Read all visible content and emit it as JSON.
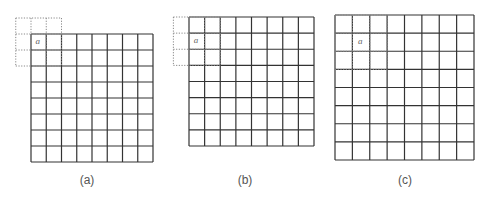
{
  "figure": {
    "panels": [
      {
        "id": "a",
        "caption": "(a)",
        "caption_x": 87,
        "grid": {
          "x": 31,
          "y": 34,
          "w": 122,
          "h": 128,
          "cols": 8,
          "rows": 8
        },
        "window": {
          "col": -1,
          "row": -1,
          "cols": 3,
          "rows": 3
        },
        "marker": {
          "label": "a",
          "col": 0,
          "row": 0
        }
      },
      {
        "id": "b",
        "caption": "(b)",
        "caption_x": 245,
        "grid": {
          "x": 189,
          "y": 17,
          "w": 125,
          "h": 129,
          "cols": 8,
          "rows": 8
        },
        "window": {
          "col": -1,
          "row": 0,
          "cols": 3,
          "rows": 3
        },
        "marker": {
          "label": "a",
          "col": 0,
          "row": 1
        }
      },
      {
        "id": "c",
        "caption": "(c)",
        "caption_x": 405,
        "grid": {
          "x": 335,
          "y": 15,
          "w": 139,
          "h": 145,
          "cols": 8,
          "rows": 8
        },
        "window": {
          "col": 0,
          "row": 0,
          "cols": 3,
          "rows": 3
        },
        "marker": {
          "label": "a",
          "col": 1,
          "row": 1
        }
      }
    ],
    "colors": {
      "grid_line": "#333333",
      "window_line": "#888888",
      "caption": "#555555",
      "marker": "#666666"
    },
    "caption_y": 173
  }
}
